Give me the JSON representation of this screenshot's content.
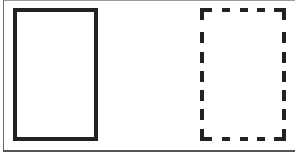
{
  "diagram": {
    "colors": {
      "background": "#ffffff",
      "stroke": "#222222",
      "frame": "#6a6a6a"
    },
    "shapes": [
      {
        "id": "solid-rectangle",
        "style": "solid",
        "stroke_width": 4
      },
      {
        "id": "dashed-rectangle",
        "style": "dashed",
        "stroke_width": 4,
        "dash": [
          8,
          7
        ]
      }
    ]
  }
}
